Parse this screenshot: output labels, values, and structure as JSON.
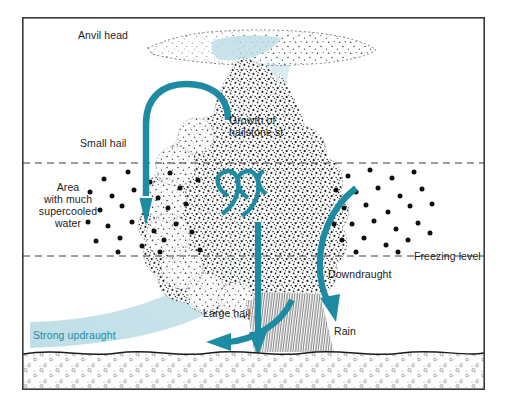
{
  "figure": {
    "type": "diagram",
    "background": "#ffffff",
    "frame": {
      "x": 22,
      "y": 17,
      "width": 463,
      "height": 373,
      "stroke": "#3a3a3a",
      "stroke_width": 1.6
    }
  },
  "colors": {
    "teal": "#1d8ba1",
    "teal_pale": "#bcdce6",
    "cloud_stipple": "#1b1b1b",
    "ink": "#1b1b1b",
    "ground": "#6f6f6f",
    "dashed": "#3a3a3a"
  },
  "labels": {
    "anvil_head": "Anvil head",
    "small_hail": "Small hail",
    "growth_line1": "Growth of",
    "growth_line2": "hailstone st",
    "area_line1": "Area",
    "area_line2": "with much",
    "area_line3": "supercooled",
    "area_line4": "water",
    "freezing_level": "Freezing level",
    "downdraught": "Downdraught",
    "rain": "Rain",
    "large_hail": "Large hail",
    "strong_updraught": "Strong updraught"
  },
  "levels": [
    {
      "name": "upper-dashed-level",
      "y": 163,
      "label": ""
    },
    {
      "name": "freezing-level",
      "y": 256,
      "label": "Freezing level"
    }
  ],
  "flows": [
    {
      "name": "small-hail-recirculation",
      "color": "#1d8ba1",
      "direction": "down",
      "description": "inverted-U arrow carrying small hail down into supercooled layer"
    },
    {
      "name": "hailstone-growth-loops",
      "color": "#1d8ba1",
      "direction": "circulating",
      "description": "spiral loops inside the updraught core"
    },
    {
      "name": "downdraught-arrow",
      "color": "#1d8ba1",
      "direction": "down-right",
      "description": "curved arrow descending on the right flank"
    },
    {
      "name": "large-hail-fall",
      "color": "#1d8ba1",
      "direction": "down",
      "description": "vertical arrow to ground"
    },
    {
      "name": "large-hail-spread",
      "color": "#1d8ba1",
      "direction": "left",
      "description": "curved arrow sweeping left above ground"
    },
    {
      "name": "strong-updraught-band",
      "color": "#bcdce6",
      "direction": "up-right",
      "description": "pale blue rising band from lower-left into the cloud"
    }
  ]
}
